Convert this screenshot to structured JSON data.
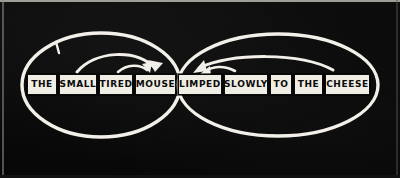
{
  "diagram": {
    "medium": "chalkboard",
    "background_color": "#080808",
    "chalk_color": "#f2f0e8",
    "box_fill_color": "#efede4",
    "box_text_color": "#0a0a0a",
    "sentence": "THE SMALL TIRED MOUSE LIMPED SLOWLY TO THE CHEESE",
    "words": [
      {
        "id": "w1",
        "text": "THE",
        "x": 27,
        "width": 30
      },
      {
        "id": "w2",
        "text": "SMALL",
        "x": 59,
        "width": 38
      },
      {
        "id": "w3",
        "text": "TIRED",
        "x": 99,
        "width": 34
      },
      {
        "id": "w4",
        "text": "MOUSE",
        "x": 135,
        "width": 41
      },
      {
        "id": "w5",
        "text": "LIMPED",
        "x": 178,
        "width": 44
      },
      {
        "id": "w6",
        "text": "SLOWLY",
        "x": 224,
        "width": 44
      },
      {
        "id": "w7",
        "text": "TO",
        "x": 270,
        "width": 22
      },
      {
        "id": "w8",
        "text": "THE",
        "x": 294,
        "width": 29
      },
      {
        "id": "w9",
        "text": "CHEESE",
        "x": 325,
        "width": 45
      }
    ],
    "groups": [
      {
        "id": "subject-phrase",
        "label": "left ellipse",
        "spans_words": [
          "THE",
          "SMALL",
          "TIRED",
          "MOUSE"
        ],
        "head_word": "MOUSE",
        "cx": 101,
        "cy": 85,
        "rx": 79,
        "ry": 52
      },
      {
        "id": "predicate-phrase",
        "label": "right ellipse",
        "spans_words": [
          "LIMPED",
          "SLOWLY",
          "TO",
          "THE",
          "CHEESE"
        ],
        "head_word": "LIMPED",
        "cx": 278,
        "cy": 85,
        "rx": 100,
        "ry": 51
      }
    ],
    "arrows": [
      {
        "id": "a1",
        "from": "SMALL",
        "to": "MOUSE",
        "direction": "right",
        "kind": "long-arc"
      },
      {
        "id": "a2",
        "from": "TIRED",
        "to": "MOUSE",
        "direction": "right",
        "kind": "short-arc"
      },
      {
        "id": "a3",
        "from": "CHEESE",
        "to": "LIMPED",
        "direction": "left",
        "kind": "long-arc"
      },
      {
        "id": "a4",
        "from": "SLOWLY",
        "to": "LIMPED",
        "direction": "left",
        "kind": "short-arc"
      }
    ],
    "marks": [
      {
        "id": "m1",
        "kind": "tick",
        "x": 57,
        "y": 46
      }
    ]
  }
}
